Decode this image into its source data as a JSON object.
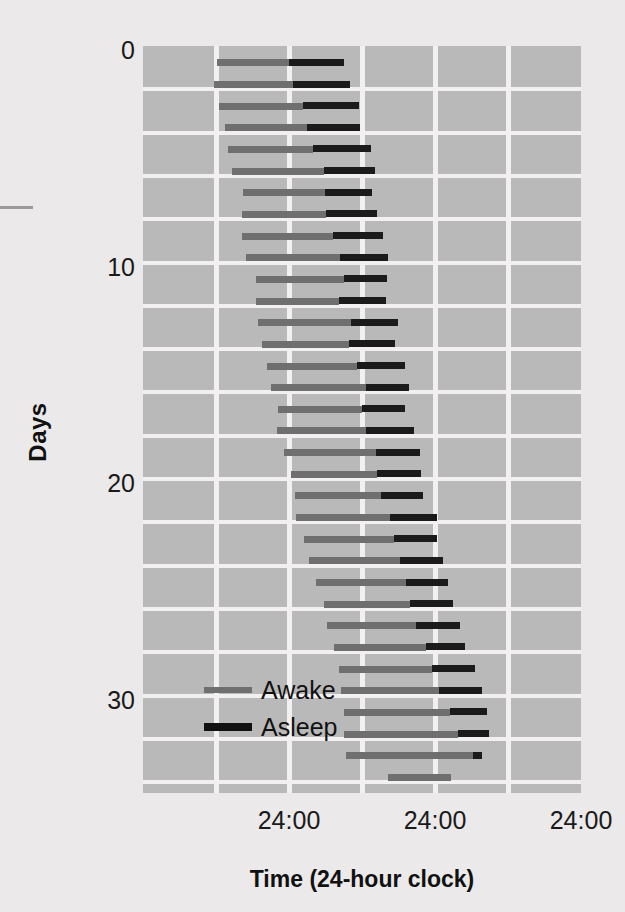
{
  "chart_data": {
    "type": "bar",
    "subtype": "actogram",
    "title": "",
    "xlabel": "Time (24-hour clock)",
    "ylabel": "Days",
    "xlim": [
      0,
      72
    ],
    "ylim": [
      0,
      34.5
    ],
    "grid": true,
    "x_gridline_hours": [
      12,
      24,
      36,
      48,
      60
    ],
    "x_ticks": [
      {
        "hour": 24,
        "label": "24:00"
      },
      {
        "hour": 48,
        "label": "24:00"
      },
      {
        "hour": 72,
        "label": "24:00"
      }
    ],
    "y_ticks": [
      {
        "day": 0,
        "label": "0"
      },
      {
        "day": 10,
        "label": "10"
      },
      {
        "day": 20,
        "label": "20"
      },
      {
        "day": 30,
        "label": "30"
      }
    ],
    "y_gridline_interval_days": 2,
    "legend": {
      "position": "inside-lower-left",
      "entries": [
        {
          "name": "Awake",
          "color": "#6f6f6f"
        },
        {
          "name": "Asleep",
          "color": "#111111"
        }
      ]
    },
    "colors": {
      "plot_background": "#b9b9b9",
      "gridline": "#f2f0f0",
      "figure_background": "#ebe9e9",
      "awake": "#6f6f6f",
      "asleep": "#1b1b1b",
      "text": "#111111"
    },
    "series": [
      {
        "name": "Awake",
        "color": "#6f6f6f"
      },
      {
        "name": "Asleep",
        "color": "#1b1b1b"
      }
    ],
    "rows": [
      {
        "day": 0,
        "awake_start": 12.2,
        "awake_end": 24.0,
        "asleep_start": 24.0,
        "asleep_end": 33.0
      },
      {
        "day": 1,
        "awake_start": 11.7,
        "awake_end": 24.7,
        "asleep_start": 24.7,
        "asleep_end": 34.0
      },
      {
        "day": 2,
        "awake_start": 12.5,
        "awake_end": 26.3,
        "asleep_start": 26.3,
        "asleep_end": 35.5
      },
      {
        "day": 3,
        "awake_start": 13.5,
        "awake_end": 27.0,
        "asleep_start": 27.0,
        "asleep_end": 35.6
      },
      {
        "day": 4,
        "awake_start": 13.9,
        "awake_end": 28.0,
        "asleep_start": 28.0,
        "asleep_end": 37.5
      },
      {
        "day": 5,
        "awake_start": 14.7,
        "awake_end": 29.8,
        "asleep_start": 29.8,
        "asleep_end": 38.2
      },
      {
        "day": 6,
        "awake_start": 16.5,
        "awake_end": 29.9,
        "asleep_start": 29.9,
        "asleep_end": 37.7
      },
      {
        "day": 7,
        "awake_start": 16.2,
        "awake_end": 30.1,
        "asleep_start": 30.1,
        "asleep_end": 38.4
      },
      {
        "day": 8,
        "awake_start": 16.3,
        "awake_end": 31.2,
        "asleep_start": 31.2,
        "asleep_end": 39.5
      },
      {
        "day": 9,
        "awake_start": 17.0,
        "awake_end": 32.4,
        "asleep_start": 32.4,
        "asleep_end": 40.2
      },
      {
        "day": 10,
        "awake_start": 18.6,
        "awake_end": 33.0,
        "asleep_start": 33.0,
        "asleep_end": 40.1
      },
      {
        "day": 11,
        "awake_start": 18.6,
        "awake_end": 32.2,
        "asleep_start": 32.2,
        "asleep_end": 40.0
      },
      {
        "day": 12,
        "awake_start": 18.9,
        "awake_end": 34.2,
        "asleep_start": 34.2,
        "asleep_end": 42.0
      },
      {
        "day": 13,
        "awake_start": 19.6,
        "awake_end": 33.9,
        "asleep_start": 33.9,
        "asleep_end": 41.5
      },
      {
        "day": 14,
        "awake_start": 20.4,
        "awake_end": 35.2,
        "asleep_start": 35.2,
        "asleep_end": 43.0
      },
      {
        "day": 15,
        "awake_start": 21.1,
        "awake_end": 36.6,
        "asleep_start": 36.6,
        "asleep_end": 43.7
      },
      {
        "day": 16,
        "awake_start": 22.2,
        "awake_end": 36.0,
        "asleep_start": 36.0,
        "asleep_end": 43.1
      },
      {
        "day": 17,
        "awake_start": 22.1,
        "awake_end": 36.6,
        "asleep_start": 36.6,
        "asleep_end": 44.6
      },
      {
        "day": 18,
        "awake_start": 23.2,
        "awake_end": 38.3,
        "asleep_start": 38.3,
        "asleep_end": 45.6
      },
      {
        "day": 19,
        "awake_start": 24.4,
        "awake_end": 38.5,
        "asleep_start": 38.5,
        "asleep_end": 45.7
      },
      {
        "day": 20,
        "awake_start": 25.0,
        "awake_end": 39.1,
        "asleep_start": 39.1,
        "asleep_end": 46.0
      },
      {
        "day": 21,
        "awake_start": 25.2,
        "awake_end": 40.6,
        "asleep_start": 40.6,
        "asleep_end": 48.3
      },
      {
        "day": 22,
        "awake_start": 26.5,
        "awake_end": 41.3,
        "asleep_start": 41.3,
        "asleep_end": 48.3
      },
      {
        "day": 23,
        "awake_start": 27.3,
        "awake_end": 42.2,
        "asleep_start": 42.2,
        "asleep_end": 49.3
      },
      {
        "day": 24,
        "awake_start": 28.5,
        "awake_end": 43.2,
        "asleep_start": 43.2,
        "asleep_end": 50.1
      },
      {
        "day": 25,
        "awake_start": 29.8,
        "awake_end": 43.9,
        "asleep_start": 43.9,
        "asleep_end": 50.9
      },
      {
        "day": 26,
        "awake_start": 30.3,
        "awake_end": 44.8,
        "asleep_start": 44.8,
        "asleep_end": 52.1
      },
      {
        "day": 27,
        "awake_start": 31.4,
        "awake_end": 46.5,
        "asleep_start": 46.5,
        "asleep_end": 53.0
      },
      {
        "day": 28,
        "awake_start": 32.2,
        "awake_end": 47.5,
        "asleep_start": 47.5,
        "asleep_end": 54.6
      },
      {
        "day": 29,
        "awake_start": 32.5,
        "awake_end": 48.7,
        "asleep_start": 48.7,
        "asleep_end": 55.8
      },
      {
        "day": 30,
        "awake_start": 33.0,
        "awake_end": 50.5,
        "asleep_start": 50.5,
        "asleep_end": 56.5
      },
      {
        "day": 31,
        "awake_start": 33.1,
        "awake_end": 51.8,
        "asleep_start": 51.8,
        "asleep_end": 56.8
      },
      {
        "day": 32,
        "awake_start": 33.4,
        "awake_end": 54.3,
        "asleep_start": 54.3,
        "asleep_end": 55.8
      },
      {
        "day": 33,
        "awake_start": 40.2,
        "awake_end": 50.6,
        "asleep_start": null,
        "asleep_end": null
      }
    ]
  }
}
